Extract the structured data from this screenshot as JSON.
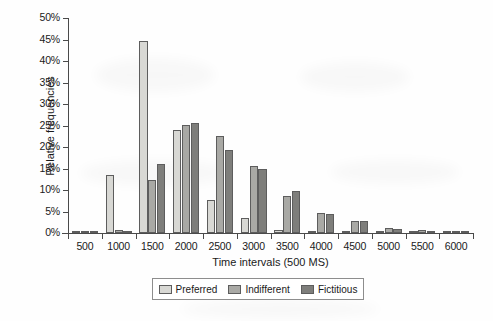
{
  "chart_data": {
    "type": "bar",
    "title": "",
    "xlabel": "Time intervals (500 MS)",
    "ylabel": "Relative frequencies",
    "categories": [
      "500",
      "1000",
      "1500",
      "2000",
      "2500",
      "3000",
      "3500",
      "4000",
      "4500",
      "5000",
      "5500",
      "6000"
    ],
    "series": [
      {
        "name": "Preferred",
        "color": "#d8d8d4",
        "values": [
          0.2,
          13.5,
          44.6,
          23.9,
          7.7,
          3.5,
          0.6,
          0.4,
          0.1,
          0.1,
          0.1,
          0.1
        ]
      },
      {
        "name": "Indifferent",
        "color": "#a9a9a5",
        "values": [
          0.2,
          0.6,
          12.3,
          25.2,
          22.5,
          15.5,
          8.6,
          4.6,
          2.9,
          1.2,
          0.7,
          0.1
        ]
      },
      {
        "name": "Fictitious",
        "color": "#7e7e7b",
        "values": [
          0.2,
          0.2,
          16.0,
          25.5,
          19.4,
          14.8,
          9.8,
          4.5,
          2.8,
          0.9,
          0.1,
          0.2
        ]
      }
    ],
    "ylim": [
      0,
      50
    ],
    "yticks": [
      0,
      5,
      10,
      15,
      20,
      25,
      30,
      35,
      40,
      45,
      50
    ],
    "ytick_labels": [
      "0%",
      "5%",
      "10%",
      "15%",
      "20%",
      "25%",
      "30%",
      "35%",
      "40%",
      "45%",
      "50%"
    ],
    "grid": false,
    "legend_position": "bottom",
    "y_unit": "%"
  },
  "axes": {
    "x_title": "Time intervals (500 MS)",
    "y_title": "Relative frequencies"
  },
  "legend": {
    "items": [
      {
        "label": "Preferred"
      },
      {
        "label": "Indifferent"
      },
      {
        "label": "Fictitious"
      }
    ]
  }
}
